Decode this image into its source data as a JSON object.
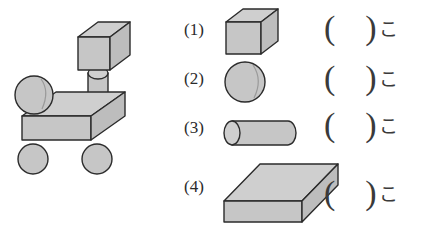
{
  "worksheet": {
    "colors": {
      "solid_fill": "#c6c6c6",
      "solid_fill_top": "#cfcfcf",
      "solid_fill_side": "#bdbdbd",
      "outline": "#2b2b2b",
      "text": "#333333",
      "background": "#ffffff"
    },
    "figure": {
      "name": "robot-vehicle-built-from-solids",
      "parts": [
        "cube-head",
        "cylinder-neck",
        "sphere-left",
        "slab-body",
        "sphere-wheel-front",
        "sphere-wheel-rear"
      ]
    },
    "items": [
      {
        "number": "(1)",
        "shape": "cube",
        "shape_name": "cube-solid",
        "answer_open": "(",
        "answer_value": "",
        "answer_close": ")",
        "counter": "こ"
      },
      {
        "number": "(2)",
        "shape": "sphere",
        "shape_name": "sphere-solid",
        "answer_open": "(",
        "answer_value": "",
        "answer_close": ")",
        "counter": "こ"
      },
      {
        "number": "(3)",
        "shape": "cylinder",
        "shape_name": "cylinder-solid",
        "answer_open": "(",
        "answer_value": "",
        "answer_close": ")",
        "counter": "こ"
      },
      {
        "number": "(4)",
        "shape": "slab",
        "shape_name": "rectangular-slab-solid",
        "answer_open": "(",
        "answer_value": "",
        "answer_close": ")",
        "counter": "こ"
      }
    ]
  }
}
